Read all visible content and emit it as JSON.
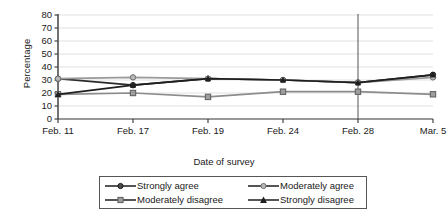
{
  "chart_data": {
    "type": "line",
    "title": "",
    "xlabel": "Date of survey",
    "ylabel": "Percentage",
    "categories": [
      "Feb. 11",
      "Feb. 17",
      "Feb. 19",
      "Feb. 24",
      "Feb. 28",
      "Mar. 5"
    ],
    "ylim": [
      0,
      80
    ],
    "yticks": [
      0,
      10,
      20,
      30,
      40,
      50,
      60,
      70,
      80
    ],
    "ytick_labels": [
      "0",
      "10",
      "20",
      "30",
      "40",
      "50",
      "60",
      "70",
      "80"
    ],
    "grid": true,
    "legend_position": "bottom",
    "series": [
      {
        "name": "Strongly agree",
        "marker": "circle-dark",
        "color": "#2b2b2b",
        "values": [
          31,
          26,
          31,
          30,
          28,
          34
        ]
      },
      {
        "name": "Moderately agree",
        "marker": "circle-light",
        "color": "#9a9a9a",
        "values": [
          31,
          32,
          31,
          30,
          28,
          32
        ]
      },
      {
        "name": "Moderately disagree",
        "marker": "square-light",
        "color": "#8c8c8c",
        "values": [
          19,
          20,
          17,
          21,
          21,
          19
        ]
      },
      {
        "name": "Strongly disagree",
        "marker": "triangle-dark",
        "color": "#1f1f1f",
        "values": [
          19,
          26,
          31,
          30,
          28,
          34
        ]
      }
    ],
    "reference_lines": [
      "Feb. 11",
      "Feb. 28"
    ]
  }
}
